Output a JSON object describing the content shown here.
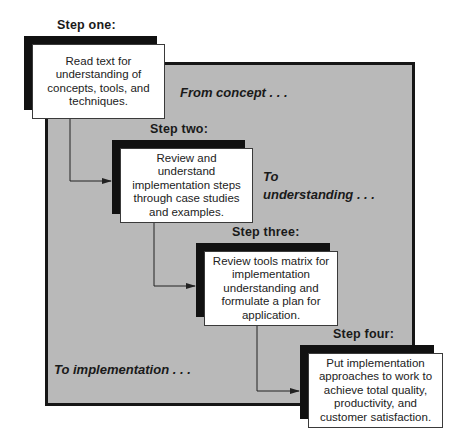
{
  "diagram": {
    "type": "process-flow",
    "colors": {
      "panel_fill": "#b9b9b9",
      "panel_border": "#161616",
      "shadow": "#111111",
      "card_fill": "#ffffff",
      "connector": "#222222"
    },
    "phases": {
      "concept": "From concept . . .",
      "understanding_line1": "To",
      "understanding_line2": "understanding . . .",
      "implementation": "To implementation . . ."
    },
    "steps": [
      {
        "label": "Step one:",
        "lines": [
          "Read text for",
          "understanding of",
          "concepts, tools, and",
          "techniques."
        ]
      },
      {
        "label": "Step two:",
        "lines": [
          "Review and understand",
          "implementation steps",
          "through case studies",
          "and examples."
        ]
      },
      {
        "label": "Step three:",
        "lines": [
          "Review tools matrix for",
          "implementation",
          "understanding and",
          "formulate a plan for",
          "application."
        ]
      },
      {
        "label": "Step four:",
        "lines": [
          "Put implementation",
          "approaches to work to",
          "achieve total quality,",
          "productivity, and",
          "customer satisfaction."
        ]
      }
    ],
    "connections": [
      {
        "from": "Step one",
        "to": "Step two"
      },
      {
        "from": "Step two",
        "to": "Step three"
      },
      {
        "from": "Step three",
        "to": "Step four"
      }
    ]
  }
}
